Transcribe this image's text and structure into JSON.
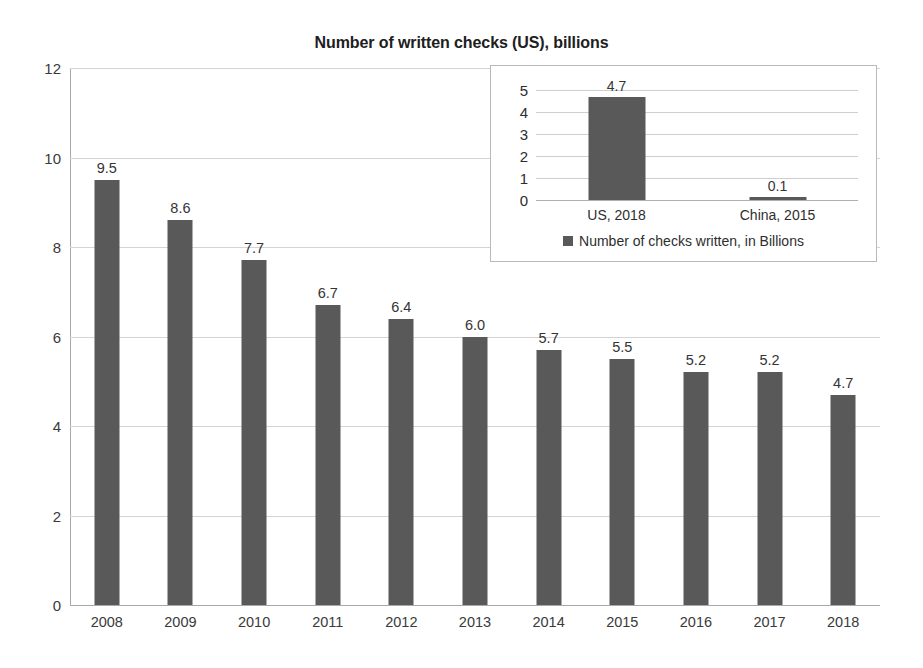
{
  "chart_data": [
    {
      "id": "main",
      "type": "bar",
      "title": "Number of written checks (US), billions",
      "xlabel": "",
      "ylabel": "",
      "ylim": [
        0,
        12
      ],
      "ytick_step": 2,
      "yticks": [
        "0",
        "2",
        "4",
        "6",
        "8",
        "10",
        "12"
      ],
      "grid": true,
      "legend": false,
      "bar_color": "#595959",
      "categories": [
        "2008",
        "2009",
        "2010",
        "2011",
        "2012",
        "2013",
        "2014",
        "2015",
        "2016",
        "2017",
        "2018"
      ],
      "values": [
        9.5,
        8.6,
        7.7,
        6.7,
        6.4,
        6.0,
        5.7,
        5.5,
        5.2,
        5.2,
        4.7
      ],
      "value_labels": [
        "9.5",
        "8.6",
        "7.7",
        "6.7",
        "6.4",
        "6.0",
        "5.7",
        "5.5",
        "5.2",
        "5.2",
        "4.7"
      ]
    },
    {
      "id": "inset",
      "type": "bar",
      "title": "",
      "xlabel": "",
      "ylabel": "",
      "ylim": [
        0,
        5
      ],
      "ytick_step": 1,
      "yticks": [
        "0",
        "1",
        "2",
        "3",
        "4",
        "5"
      ],
      "grid": true,
      "legend": true,
      "legend_position": "bottom",
      "legend_entries": [
        "Number of checks written, in Billions"
      ],
      "bar_color": "#595959",
      "categories": [
        "US, 2018",
        "China, 2015"
      ],
      "values": [
        4.7,
        0.1
      ],
      "value_labels": [
        "4.7",
        "0.1"
      ]
    }
  ]
}
